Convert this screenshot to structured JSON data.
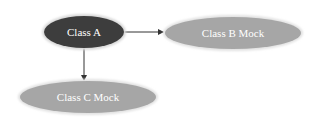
{
  "diagram": {
    "type": "class-dependency-graph",
    "nodes": [
      {
        "id": "class-a",
        "label": "Class A",
        "fill": "#3d3d3d",
        "text_color": "#ffffff",
        "cx": 84,
        "cy": 32,
        "rx": 40,
        "ry": 16
      },
      {
        "id": "class-b-mock",
        "label": "Class B Mock",
        "fill": "#a6a6a6",
        "text_color": "#ffffff",
        "cx": 233,
        "cy": 33,
        "rx": 68,
        "ry": 16
      },
      {
        "id": "class-c-mock",
        "label": "Class C Mock",
        "fill": "#a6a6a6",
        "text_color": "#ffffff",
        "cx": 88,
        "cy": 97,
        "rx": 68,
        "ry": 16
      }
    ],
    "edges": [
      {
        "from": "class-a",
        "to": "class-b-mock"
      },
      {
        "from": "class-a",
        "to": "class-c-mock"
      }
    ],
    "edge_color": "#333333"
  }
}
